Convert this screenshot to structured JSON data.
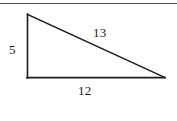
{
  "figure": {
    "type": "right-triangle-diagram",
    "background_color": "#ffffff",
    "stroke_color": "#1c1c1c",
    "rule_color": "#4a4a4a",
    "labels": {
      "vertical_leg": "5",
      "hypotenuse": "13",
      "horizontal_leg": "12"
    },
    "geometry": {
      "vertex_top_left": [
        27,
        14
      ],
      "vertex_bottom_left": [
        27,
        78
      ],
      "vertex_bottom_right": [
        165,
        78
      ]
    }
  }
}
